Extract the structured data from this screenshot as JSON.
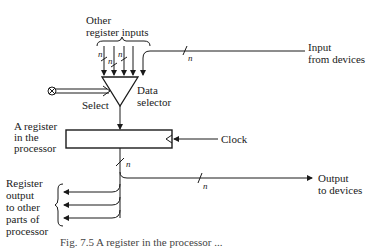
{
  "diagram": {
    "labels": {
      "other_register_inputs_line1": "Other",
      "other_register_inputs_line2": "register  inputs",
      "input_from_devices_line1": "Input",
      "input_from_devices_line2": "from devices",
      "data_selector_line1": "Data",
      "data_selector_line2": "selector",
      "select": "Select",
      "register_line1": "A register",
      "register_line2": "in the",
      "register_line3": "processor",
      "clock": "Clock",
      "output_to_devices_line1": "Output",
      "output_to_devices_line2": "to devices",
      "register_output_line1": "Register",
      "register_output_line2": "output",
      "register_output_line3": "to other",
      "register_output_line4": "parts of",
      "register_output_line5": "processor"
    },
    "bus_width": "n",
    "caption": "Fig. 7.5  A register in the processor ..."
  }
}
